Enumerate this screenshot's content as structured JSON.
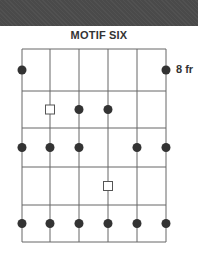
{
  "title": "MOTIF SIX",
  "fret_label": "8 fr",
  "colors": {
    "header": "#4a4a4a",
    "grid": "#666666",
    "dot": "#333333",
    "square_stroke": "#555555"
  },
  "grid": {
    "strings": 6,
    "string_x": [
      22,
      50,
      79,
      108,
      137,
      166
    ],
    "fret_y": [
      49,
      91,
      128,
      167,
      205,
      242
    ]
  },
  "markers": [
    {
      "fret": 1,
      "string": 1,
      "type": "dot"
    },
    {
      "fret": 1,
      "string": 6,
      "type": "dot"
    },
    {
      "fret": 2,
      "string": 2,
      "type": "square"
    },
    {
      "fret": 2,
      "string": 3,
      "type": "dot"
    },
    {
      "fret": 2,
      "string": 4,
      "type": "dot"
    },
    {
      "fret": 3,
      "string": 1,
      "type": "dot"
    },
    {
      "fret": 3,
      "string": 2,
      "type": "dot"
    },
    {
      "fret": 3,
      "string": 3,
      "type": "dot"
    },
    {
      "fret": 3,
      "string": 5,
      "type": "dot"
    },
    {
      "fret": 3,
      "string": 6,
      "type": "dot"
    },
    {
      "fret": 4,
      "string": 4,
      "type": "square"
    },
    {
      "fret": 5,
      "string": 1,
      "type": "dot"
    },
    {
      "fret": 5,
      "string": 2,
      "type": "dot"
    },
    {
      "fret": 5,
      "string": 3,
      "type": "dot"
    },
    {
      "fret": 5,
      "string": 4,
      "type": "dot"
    },
    {
      "fret": 5,
      "string": 5,
      "type": "dot"
    },
    {
      "fret": 5,
      "string": 6,
      "type": "dot"
    }
  ]
}
